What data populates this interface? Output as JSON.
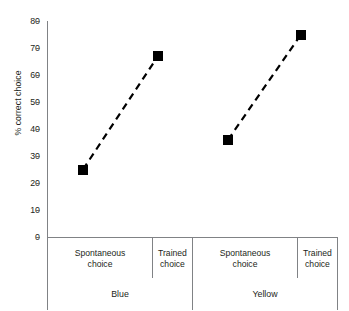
{
  "chart_data": {
    "type": "line",
    "title": "",
    "xlabel": "",
    "ylabel": "% correct choice",
    "ylim": [
      0,
      80
    ],
    "yticks": [
      0,
      10,
      20,
      30,
      40,
      50,
      60,
      70,
      80
    ],
    "ytick_labels": [
      "0",
      "10",
      "20",
      "30",
      "40",
      "50",
      "60",
      "70",
      "80"
    ],
    "grid": false,
    "legend_position": "none",
    "line_style": "dashed",
    "marker_style": "filled-square",
    "marker_color": "#000000",
    "line_color": "#000000",
    "axis_color": "#808285",
    "groups": [
      {
        "name": "Blue",
        "categories": [
          "Spontaneous choice",
          "Trained choice"
        ],
        "values": [
          25,
          67
        ]
      },
      {
        "name": "Yellow",
        "categories": [
          "Spontaneous choice",
          "Trained choice"
        ],
        "values": [
          36,
          75
        ]
      }
    ],
    "categories": [
      "Spontaneous choice",
      "Trained choice",
      "Spontaneous choice",
      "Trained choice"
    ],
    "values": [
      25,
      67,
      36,
      75
    ]
  },
  "axis": {
    "y_label": "% correct choice",
    "y_ticks": [
      "80",
      "70",
      "60",
      "50",
      "40",
      "30",
      "20",
      "10",
      "0"
    ]
  },
  "categories": {
    "blue_spontaneous_line1": "Spontaneous",
    "blue_spontaneous_line2": "choice",
    "blue_trained_line1": "Trained",
    "blue_trained_line2": "choice",
    "yellow_spontaneous_line1": "Spontaneous",
    "yellow_spontaneous_line2": "choice",
    "yellow_trained_line1": "Trained",
    "yellow_trained_line2": "choice",
    "group_blue": "Blue",
    "group_yellow": "Yellow"
  }
}
